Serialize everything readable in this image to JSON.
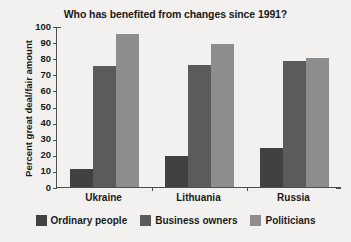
{
  "chart_data": {
    "type": "bar",
    "title": "Who has benefited from changes since 1991?",
    "xlabel": "",
    "ylabel": "Percent great deal/fair amount",
    "ylim": [
      0,
      100
    ],
    "ytick_step": 10,
    "yticks": [
      "0",
      "10",
      "20",
      "30",
      "40",
      "50",
      "60",
      "70",
      "80",
      "90",
      "100"
    ],
    "grid": false,
    "legend_position": "bottom",
    "categories": [
      "Ukraine",
      "Lithuania",
      "Russia"
    ],
    "series": [
      {
        "name": "Ordinary people",
        "color": "#414141",
        "values": [
          11,
          19,
          24
        ]
      },
      {
        "name": "Business owners",
        "color": "#5b5b5b",
        "values": [
          75,
          76,
          78
        ]
      },
      {
        "name": "Politicians",
        "color": "#8d8d8d",
        "values": [
          95,
          89,
          80
        ]
      }
    ]
  },
  "colors": {
    "background": "#f2f1ef",
    "axis": "#4d4d4d",
    "text": "#1a1a1a"
  }
}
